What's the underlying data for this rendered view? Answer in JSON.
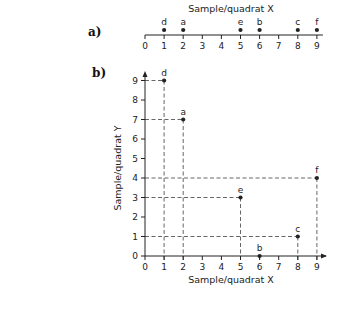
{
  "chart_data": [
    {
      "panel": "a)",
      "type": "scatter",
      "title": "Sample/quadrat X",
      "xlabel": "Sample/quadrat X",
      "xlim": [
        0,
        9
      ],
      "x_ticks": [
        0,
        1,
        2,
        3,
        4,
        5,
        6,
        7,
        8,
        9
      ],
      "points": [
        {
          "label": "d",
          "x": 1
        },
        {
          "label": "a",
          "x": 2
        },
        {
          "label": "e",
          "x": 5
        },
        {
          "label": "b",
          "x": 6
        },
        {
          "label": "c",
          "x": 8
        },
        {
          "label": "f",
          "x": 9
        }
      ]
    },
    {
      "panel": "b)",
      "type": "scatter",
      "xlabel": "Sample/quadrat X",
      "ylabel": "Sample/quadrat Y",
      "xlim": [
        0,
        9
      ],
      "ylim": [
        0,
        9
      ],
      "x_ticks": [
        0,
        1,
        2,
        3,
        4,
        5,
        6,
        7,
        8,
        9
      ],
      "y_ticks": [
        0,
        1,
        2,
        3,
        4,
        5,
        6,
        7,
        8,
        9
      ],
      "projection_lines": "dashed",
      "points": [
        {
          "label": "d",
          "x": 1,
          "y": 9
        },
        {
          "label": "a",
          "x": 2,
          "y": 7
        },
        {
          "label": "e",
          "x": 5,
          "y": 3
        },
        {
          "label": "b",
          "x": 6,
          "y": 0
        },
        {
          "label": "c",
          "x": 8,
          "y": 1
        },
        {
          "label": "f",
          "x": 9,
          "y": 4
        }
      ]
    }
  ],
  "labels": {
    "panel_a": "a)",
    "panel_b": "b)",
    "a_title": "Sample/quadrat X",
    "b_xlabel": "Sample/quadrat X",
    "b_ylabel": "Sample/quadrat Y"
  },
  "colors": {
    "ink": "#222222",
    "dash": "#555555"
  }
}
